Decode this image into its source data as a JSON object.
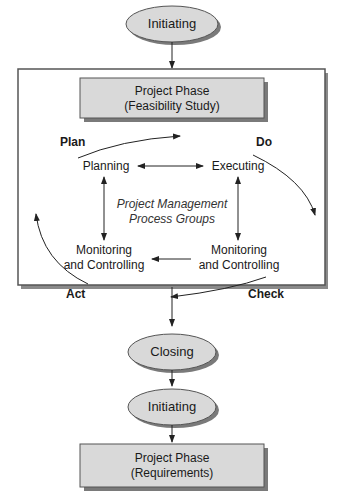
{
  "diagram": {
    "top_node": {
      "label": "Initiating"
    },
    "phase_box_1": {
      "line1": "Project Phase",
      "line2": "(Feasibility Study)"
    },
    "cycle": {
      "plan_label": "Plan",
      "do_label": "Do",
      "check_label": "Check",
      "act_label": "Act",
      "planning": "Planning",
      "executing": "Executing",
      "center_line1": "Project Management",
      "center_line2": "Process Groups",
      "monitoring_left_line1": "Monitoring",
      "monitoring_left_line2": "and Controlling",
      "monitoring_right_line1": "Monitoring",
      "monitoring_right_line2": "and Controlling"
    },
    "closing_node": {
      "label": "Closing"
    },
    "initiating_node_2": {
      "label": "Initiating"
    },
    "phase_box_2": {
      "line1": "Project Phase",
      "line2": "(Requirements)"
    }
  },
  "colors": {
    "fill": "#d9d9d9",
    "stroke": "#555555",
    "shadow": "#7a7a7a"
  }
}
